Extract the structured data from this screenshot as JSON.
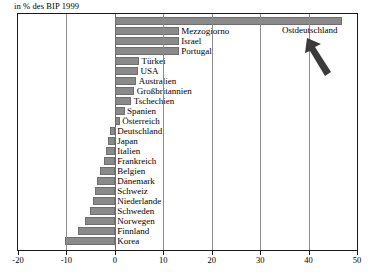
{
  "caption": "in % des BIP 1999",
  "colors": {
    "bar_fill": "#8a8a8a",
    "bar_stroke": "#6e6e6e",
    "frame": "#1a1a1a",
    "grid": "#8d8d8d",
    "text": "#000000"
  },
  "annotation": {
    "label": "Ostdeutschland",
    "icon": "arrow-up-left-icon"
  },
  "axis": {
    "ticks": [
      -20,
      -10,
      0,
      10,
      20,
      30,
      40,
      50
    ],
    "tick_labels": [
      "-20",
      "-10",
      "0",
      "10",
      "20",
      "30",
      "40",
      "50"
    ],
    "min": -20,
    "max": 50
  },
  "chart_data": {
    "type": "bar",
    "orientation": "horizontal",
    "title": "",
    "subtitle": "in % des BIP 1999",
    "xlabel": "",
    "ylabel": "",
    "xlim": [
      -20,
      50
    ],
    "grid": true,
    "legend": null,
    "annotations": [
      {
        "text": "Ostdeutschland",
        "points_to": "Ostdeutschland",
        "value": 47.0
      }
    ],
    "categories": [
      "Ostdeutschland",
      "Mezzogiorno",
      "Israel",
      "Portugal",
      "Türkei",
      "USA",
      "Australien",
      "Großbritannien",
      "Tschechien",
      "Spanien",
      "Österreich",
      "Deutschland",
      "Japan",
      "Italien",
      "Frankreich",
      "Belgien",
      "Dänemark",
      "Schweiz",
      "Niederlande",
      "Schweden",
      "Norwegen",
      "Finnland",
      "Korea"
    ],
    "values": [
      47.0,
      13.2,
      13.2,
      13.2,
      5.0,
      4.8,
      4.4,
      4.0,
      3.4,
      2.0,
      1.0,
      -1.0,
      -1.4,
      -1.8,
      -2.2,
      -3.0,
      -3.6,
      -4.0,
      -4.6,
      -5.2,
      -6.2,
      -7.6,
      -10.2
    ]
  }
}
